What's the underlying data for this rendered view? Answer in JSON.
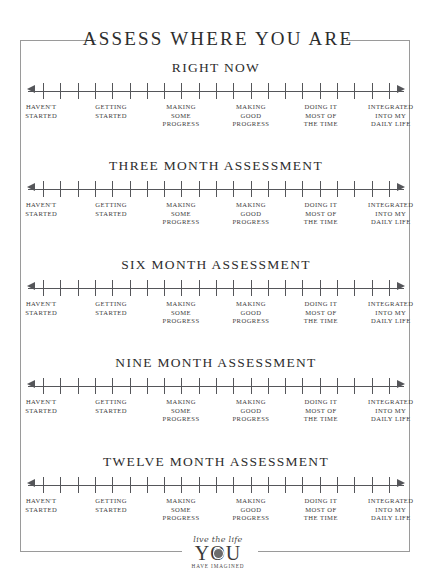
{
  "page": {
    "title": "ASSESS WHERE YOU ARE"
  },
  "scale": {
    "tick_count": 21,
    "arrow_left": "left-arrow-icon",
    "arrow_right": "right-arrow-icon",
    "labels": [
      {
        "line1": "HAVEN'T",
        "line2": "STARTED",
        "line3": ""
      },
      {
        "line1": "GETTING",
        "line2": "STARTED",
        "line3": ""
      },
      {
        "line1": "MAKING",
        "line2": "SOME",
        "line3": "PROGRESS"
      },
      {
        "line1": "MAKING",
        "line2": "GOOD",
        "line3": "PROGRESS"
      },
      {
        "line1": "DOING IT",
        "line2": "MOST OF",
        "line3": "THE TIME"
      },
      {
        "line1": "INTEGRATED",
        "line2": "INTO MY",
        "line3": "DAILY LIFE"
      }
    ]
  },
  "rows": [
    {
      "title": "RIGHT NOW"
    },
    {
      "title": "THREE MONTH ASSESSMENT"
    },
    {
      "title": "SIX MONTH ASSESSMENT"
    },
    {
      "title": "NINE MONTH ASSESSMENT"
    },
    {
      "title": "TWELVE MONTH ASSESSMENT"
    }
  ],
  "logo": {
    "script": "live the life",
    "word": "YOU",
    "tagline": "HAVE IMAGINED"
  },
  "colors": {
    "ink": "#3a3a3a",
    "rule": "#55565a",
    "frame": "#9a9a9a",
    "paper": "#ffffff"
  }
}
